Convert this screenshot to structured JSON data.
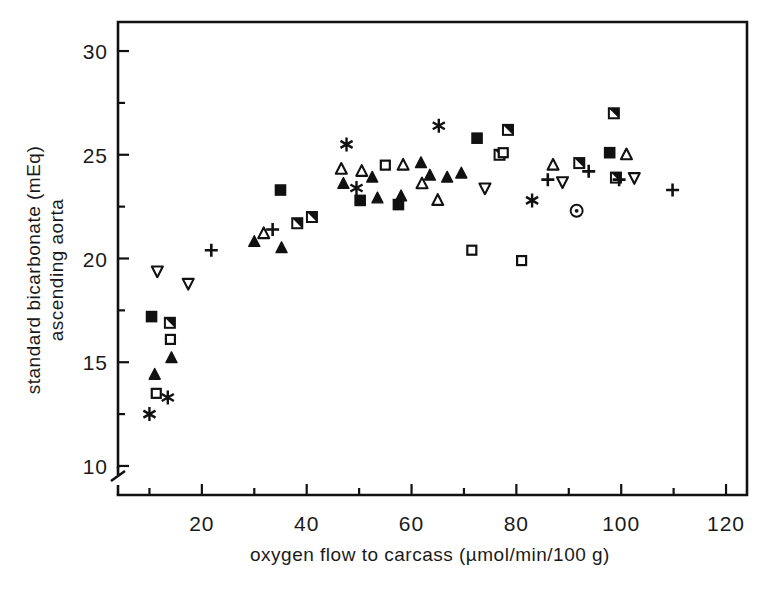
{
  "figure": {
    "type": "scatter-plot",
    "background": "#ffffff",
    "ink_color": "#111111"
  },
  "axes": {
    "x": {
      "label": "oxygen flow to carcass (µmol/min/100 g)",
      "tick_labels": [
        "20",
        "40",
        "60",
        "80",
        "100",
        "120"
      ],
      "tick_values": [
        20,
        40,
        60,
        80,
        100,
        120
      ],
      "minor_tick_values": [
        10,
        30,
        50,
        70,
        90,
        110
      ],
      "range": [
        4,
        124
      ]
    },
    "y": {
      "label_line1": "standard bicarbonate (mEq)",
      "label_line2": "ascending aorta",
      "tick_labels": [
        "10",
        "15",
        "20",
        "25",
        "30"
      ],
      "tick_values": [
        10,
        15,
        20,
        25,
        30
      ],
      "minor_tick_values": [
        12.5,
        17.5,
        22.5,
        27.5
      ],
      "range": [
        8.6,
        31.4
      ],
      "has_axis_break": true,
      "axis_break_symbol": "broken-axis-zigzag"
    }
  },
  "chart_data": {
    "type": "scatter",
    "title": "",
    "xlabel": "oxygen flow to carcass (µmol/min/100 g)",
    "ylabel": "standard bicarbonate (mEq) ascending aorta",
    "xlim": [
      4,
      124
    ],
    "ylim": [
      8.6,
      31.4
    ],
    "grid": false,
    "legend": "none",
    "marker_kinds": [
      "filled-square",
      "half-filled-square",
      "open-square",
      "filled-triangle-up",
      "open-triangle-up",
      "open-triangle-down",
      "plus",
      "asterisk",
      "dotted-circle"
    ],
    "series": [
      {
        "name": "filled-square",
        "marker": "filled-square",
        "points": [
          {
            "x": 10.4,
            "y": 17.2
          },
          {
            "x": 35.0,
            "y": 23.3
          },
          {
            "x": 50.2,
            "y": 22.8
          },
          {
            "x": 57.5,
            "y": 22.6
          },
          {
            "x": 72.5,
            "y": 25.8
          },
          {
            "x": 97.8,
            "y": 25.1
          }
        ]
      },
      {
        "name": "half-filled-square",
        "marker": "half-filled-square",
        "points": [
          {
            "x": 13.9,
            "y": 16.9
          },
          {
            "x": 38.2,
            "y": 21.7
          },
          {
            "x": 41.0,
            "y": 22.0
          },
          {
            "x": 76.8,
            "y": 25.0
          },
          {
            "x": 78.4,
            "y": 26.2
          },
          {
            "x": 92.0,
            "y": 24.6
          },
          {
            "x": 98.6,
            "y": 27.0
          },
          {
            "x": 99.0,
            "y": 23.9
          }
        ]
      },
      {
        "name": "open-square",
        "marker": "open-square",
        "points": [
          {
            "x": 11.3,
            "y": 13.5
          },
          {
            "x": 14.0,
            "y": 16.1
          },
          {
            "x": 55.0,
            "y": 24.5
          },
          {
            "x": 71.5,
            "y": 20.4
          },
          {
            "x": 77.5,
            "y": 25.1
          },
          {
            "x": 81.0,
            "y": 19.9
          }
        ]
      },
      {
        "name": "filled-triangle-up",
        "marker": "filled-triangle-up",
        "points": [
          {
            "x": 11.0,
            "y": 14.4
          },
          {
            "x": 14.2,
            "y": 15.2
          },
          {
            "x": 30.0,
            "y": 20.8
          },
          {
            "x": 35.2,
            "y": 20.5
          },
          {
            "x": 47.0,
            "y": 23.6
          },
          {
            "x": 52.5,
            "y": 23.9
          },
          {
            "x": 53.5,
            "y": 22.9
          },
          {
            "x": 58.0,
            "y": 23.0
          },
          {
            "x": 61.8,
            "y": 24.6
          },
          {
            "x": 63.5,
            "y": 24.0
          },
          {
            "x": 66.8,
            "y": 23.9
          },
          {
            "x": 69.5,
            "y": 24.1
          }
        ]
      },
      {
        "name": "open-triangle-up",
        "marker": "open-triangle-up",
        "points": [
          {
            "x": 31.8,
            "y": 21.2
          },
          {
            "x": 46.6,
            "y": 24.3
          },
          {
            "x": 50.5,
            "y": 24.2
          },
          {
            "x": 58.4,
            "y": 24.5
          },
          {
            "x": 62.0,
            "y": 23.6
          },
          {
            "x": 65.0,
            "y": 22.8
          },
          {
            "x": 87.0,
            "y": 24.5
          },
          {
            "x": 101.0,
            "y": 25.0
          }
        ]
      },
      {
        "name": "open-triangle-down",
        "marker": "open-triangle-down",
        "points": [
          {
            "x": 11.5,
            "y": 19.4
          },
          {
            "x": 17.4,
            "y": 18.8
          },
          {
            "x": 74.0,
            "y": 23.4
          },
          {
            "x": 88.8,
            "y": 23.7
          },
          {
            "x": 102.5,
            "y": 23.9
          }
        ]
      },
      {
        "name": "plus",
        "marker": "plus",
        "points": [
          {
            "x": 21.8,
            "y": 20.4
          },
          {
            "x": 33.5,
            "y": 21.4
          },
          {
            "x": 86.0,
            "y": 23.8
          },
          {
            "x": 93.8,
            "y": 24.2
          },
          {
            "x": 99.6,
            "y": 23.8
          },
          {
            "x": 109.8,
            "y": 23.3
          }
        ]
      },
      {
        "name": "asterisk",
        "marker": "asterisk",
        "points": [
          {
            "x": 10.0,
            "y": 12.5
          },
          {
            "x": 13.5,
            "y": 13.3
          },
          {
            "x": 47.6,
            "y": 25.5
          },
          {
            "x": 49.5,
            "y": 23.4
          },
          {
            "x": 65.2,
            "y": 26.4
          },
          {
            "x": 83.0,
            "y": 22.8
          }
        ]
      },
      {
        "name": "dotted-circle",
        "marker": "dotted-circle",
        "points": [
          {
            "x": 91.5,
            "y": 22.3
          }
        ]
      }
    ]
  }
}
